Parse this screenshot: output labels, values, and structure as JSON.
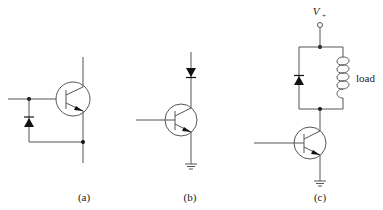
{
  "figure": {
    "panels": [
      {
        "id": "a",
        "label": "(a)",
        "description": "NPN transistor with diode from emitter to base (reverse base-emitter protection)"
      },
      {
        "id": "b",
        "label": "(b)",
        "description": "NPN transistor with series diode in collector, emitter grounded"
      },
      {
        "id": "c",
        "label": "(c)",
        "description": "NPN transistor driving inductive load with flyback diode to V+"
      }
    ],
    "supply_label": "V",
    "supply_subscript": "+",
    "load_label": "load"
  },
  "colors": {
    "wire": "#555555",
    "fill": "#111111",
    "text": "#222222"
  }
}
